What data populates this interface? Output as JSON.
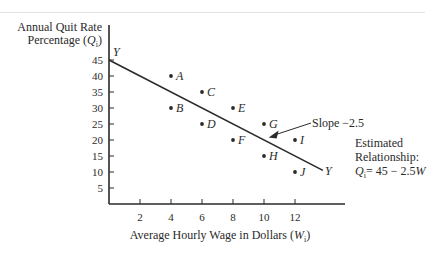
{
  "chart_data": {
    "type": "scatter",
    "title": "",
    "xlabel": "Average Hourly Wage in Dollars (W_i)",
    "ylabel": "Annual Quit Rate Percentage (Q_i)",
    "xlim": [
      0,
      15
    ],
    "ylim": [
      0,
      47
    ],
    "x_ticks": [
      2,
      4,
      6,
      8,
      10,
      12
    ],
    "y_ticks": [
      5,
      10,
      15,
      20,
      25,
      30,
      35,
      40,
      45
    ],
    "grid": false,
    "legend": null,
    "points": [
      {
        "label": "A",
        "x": 4,
        "y": 40
      },
      {
        "label": "B",
        "x": 4,
        "y": 30
      },
      {
        "label": "C",
        "x": 6,
        "y": 35
      },
      {
        "label": "D",
        "x": 6,
        "y": 25
      },
      {
        "label": "E",
        "x": 8,
        "y": 30
      },
      {
        "label": "F",
        "x": 8,
        "y": 20
      },
      {
        "label": "G",
        "x": 10,
        "y": 25
      },
      {
        "label": "H",
        "x": 10,
        "y": 15
      },
      {
        "label": "I",
        "x": 12,
        "y": 20
      },
      {
        "label": "J",
        "x": 12,
        "y": 10
      }
    ],
    "regression_line": {
      "label": "Y",
      "intercept": 45,
      "slope": -2.5,
      "x_range": [
        0,
        13.8
      ]
    },
    "annotations": [
      {
        "text": "Slope −2.5",
        "arrow_to": {
          "x": 10.3,
          "y": 20.8
        }
      },
      {
        "text": "Estimated Relationship: Q_i = 45 − 2.5W",
        "position": "right"
      }
    ]
  },
  "labels": {
    "ylabel_line1": "Annual Quit Rate",
    "ylabel_line2_prefix": "Percentage (",
    "ylabel_var": "Q",
    "ylabel_sub": "i",
    "ylabel_suffix": ")",
    "xlabel_prefix": "Average Hourly Wage in Dollars (",
    "xlabel_var": "W",
    "xlabel_sub": "i",
    "xlabel_suffix": ")",
    "line_label": "Y",
    "slope_text": "Slope −2.5",
    "rel_line1": "Estimated",
    "rel_line2": "Relationship:",
    "rel_var": "Q",
    "rel_sub": "i",
    "rel_eq": "= 45 − 2.5",
    "rel_wvar": "W"
  }
}
